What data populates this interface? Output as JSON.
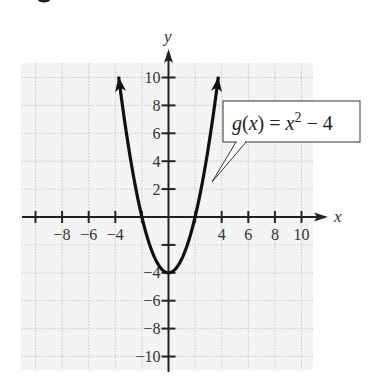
{
  "chart_data": {
    "type": "line",
    "title": "",
    "function_label": "g(x) = x² − 4",
    "function_label_parts": {
      "name": "g",
      "var": "x",
      "eq": "=",
      "base": "x",
      "exp": "2",
      "rest": "− 4"
    },
    "xlabel": "x",
    "ylabel": "y",
    "xlim": [
      -10,
      10
    ],
    "ylim": [
      -10,
      10
    ],
    "grid": true,
    "grid_step": 2,
    "x_ticks": [
      -10,
      -8,
      -6,
      -4,
      -2,
      2,
      4,
      6,
      8,
      10
    ],
    "x_tick_labels": [
      {
        "value": -8,
        "label": "−8"
      },
      {
        "value": -6,
        "label": "−6"
      },
      {
        "value": -4,
        "label": "−4"
      },
      {
        "value": 4,
        "label": "4"
      },
      {
        "value": 6,
        "label": "6"
      },
      {
        "value": 8,
        "label": "8"
      },
      {
        "value": 10,
        "label": "10"
      }
    ],
    "y_ticks": [
      -10,
      -8,
      -6,
      -4,
      -2,
      2,
      4,
      6,
      8,
      10
    ],
    "y_tick_labels": [
      {
        "value": 10,
        "label": "10"
      },
      {
        "value": 8,
        "label": "8"
      },
      {
        "value": 6,
        "label": "6"
      },
      {
        "value": 4,
        "label": "4"
      },
      {
        "value": 2,
        "label": "2"
      },
      {
        "value": -4,
        "label": "−4"
      },
      {
        "value": -6,
        "label": "−6"
      },
      {
        "value": -8,
        "label": "−8"
      },
      {
        "value": -10,
        "label": "−10"
      }
    ],
    "series": [
      {
        "name": "g(x) = x^2 - 4",
        "x": [
          -3.75,
          -3.5,
          -3,
          -2.5,
          -2,
          -1.5,
          -1,
          -0.5,
          0,
          0.5,
          1,
          1.5,
          2,
          2.5,
          3,
          3.5,
          3.75
        ],
        "y": [
          10.06,
          8.25,
          5,
          2.25,
          0,
          -1.75,
          -3,
          -3.75,
          -4,
          -3.75,
          -3,
          -1.75,
          0,
          2.25,
          5,
          8.25,
          10.06
        ],
        "arrows_both_ends": true
      }
    ],
    "key_points": {
      "vertex": [
        0,
        -4
      ],
      "x_intercepts": [
        [
          -2,
          0
        ],
        [
          2,
          0
        ]
      ]
    }
  },
  "colors": {
    "curve": "#111111",
    "axes": "#222222",
    "grid_bg": "#f4f4f4",
    "grid_line": "#c8c8c8"
  }
}
